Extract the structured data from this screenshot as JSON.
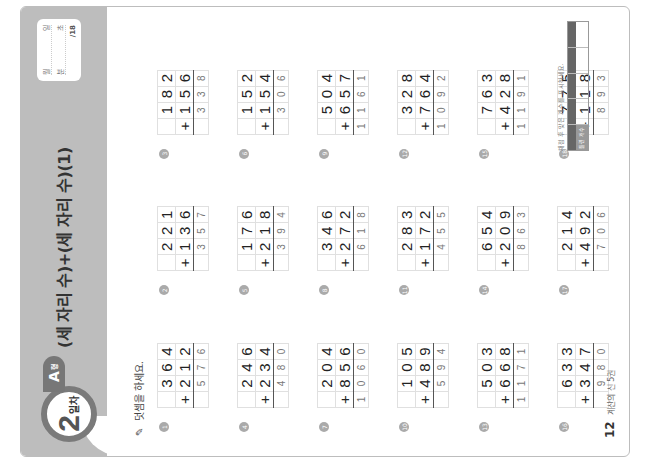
{
  "header": {
    "day_number": "2",
    "day_label": "일차",
    "type_letter": "A",
    "type_suffix": "형",
    "title": "(세 자리 수)+(세 자리 수)(1)",
    "score_box": {
      "date_labels": [
        "월",
        "일"
      ],
      "time_labels": [
        "분",
        "초"
      ],
      "score_total": "/18"
    }
  },
  "instruction": "덧셈을 하세요.",
  "problems": [
    {
      "num": "1",
      "top": [
        "",
        "3",
        "6",
        "4"
      ],
      "bottom": [
        "+",
        "2",
        "1",
        "2"
      ],
      "answer": [
        "",
        "5",
        "7",
        "6"
      ]
    },
    {
      "num": "2",
      "top": [
        "",
        "2",
        "2",
        "1"
      ],
      "bottom": [
        "+",
        "1",
        "3",
        "6"
      ],
      "answer": [
        "",
        "3",
        "5",
        "7"
      ]
    },
    {
      "num": "3",
      "top": [
        "",
        "1",
        "8",
        "2"
      ],
      "bottom": [
        "+",
        "1",
        "5",
        "6"
      ],
      "answer": [
        "",
        "3",
        "3",
        "8"
      ]
    },
    {
      "num": "4",
      "top": [
        "",
        "2",
        "4",
        "6"
      ],
      "bottom": [
        "+",
        "2",
        "3",
        "4"
      ],
      "answer": [
        "",
        "4",
        "8",
        "0"
      ]
    },
    {
      "num": "5",
      "top": [
        "",
        "1",
        "7",
        "6"
      ],
      "bottom": [
        "+",
        "2",
        "1",
        "8"
      ],
      "answer": [
        "",
        "3",
        "9",
        "4"
      ]
    },
    {
      "num": "6",
      "top": [
        "",
        "1",
        "5",
        "2"
      ],
      "bottom": [
        "+",
        "1",
        "5",
        "4"
      ],
      "answer": [
        "",
        "3",
        "0",
        "6"
      ]
    },
    {
      "num": "7",
      "top": [
        "",
        "2",
        "0",
        "4"
      ],
      "bottom": [
        "+",
        "8",
        "5",
        "6"
      ],
      "answer": [
        "1",
        "0",
        "6",
        "0"
      ]
    },
    {
      "num": "8",
      "top": [
        "",
        "3",
        "4",
        "6"
      ],
      "bottom": [
        "+",
        "2",
        "7",
        "2"
      ],
      "answer": [
        "",
        "6",
        "1",
        "8"
      ]
    },
    {
      "num": "9",
      "top": [
        "",
        "5",
        "0",
        "4"
      ],
      "bottom": [
        "+",
        "6",
        "5",
        "7"
      ],
      "answer": [
        "1",
        "1",
        "6",
        "1"
      ]
    },
    {
      "num": "10",
      "top": [
        "",
        "1",
        "0",
        "5"
      ],
      "bottom": [
        "+",
        "4",
        "8",
        "9"
      ],
      "answer": [
        "",
        "5",
        "9",
        "4"
      ]
    },
    {
      "num": "11",
      "top": [
        "",
        "2",
        "8",
        "3"
      ],
      "bottom": [
        "+",
        "1",
        "7",
        "2"
      ],
      "answer": [
        "",
        "4",
        "5",
        "5"
      ]
    },
    {
      "num": "12",
      "top": [
        "",
        "3",
        "2",
        "8"
      ],
      "bottom": [
        "+",
        "7",
        "6",
        "4"
      ],
      "answer": [
        "1",
        "0",
        "9",
        "2"
      ]
    },
    {
      "num": "13",
      "top": [
        "",
        "5",
        "0",
        "3"
      ],
      "bottom": [
        "+",
        "6",
        "6",
        "8"
      ],
      "answer": [
        "1",
        "1",
        "7",
        "1"
      ]
    },
    {
      "num": "14",
      "top": [
        "",
        "6",
        "5",
        "4"
      ],
      "bottom": [
        "+",
        "2",
        "0",
        "9"
      ],
      "answer": [
        "",
        "8",
        "6",
        "3"
      ]
    },
    {
      "num": "15",
      "top": [
        "",
        "7",
        "6",
        "3"
      ],
      "bottom": [
        "+",
        "4",
        "2",
        "8"
      ],
      "answer": [
        "1",
        "1",
        "9",
        "1"
      ]
    },
    {
      "num": "16",
      "top": [
        "",
        "6",
        "3",
        "3"
      ],
      "bottom": [
        "+",
        "3",
        "4",
        "7"
      ],
      "answer": [
        "",
        "9",
        "8",
        "0"
      ]
    },
    {
      "num": "17",
      "top": [
        "",
        "2",
        "1",
        "4"
      ],
      "bottom": [
        "+",
        "4",
        "9",
        "2"
      ],
      "answer": [
        "",
        "7",
        "0",
        "6"
      ]
    },
    {
      "num": "18",
      "top": [
        "",
        "7",
        "7",
        "5"
      ],
      "bottom": [
        "+",
        "1",
        "1",
        "8"
      ],
      "answer": [
        "",
        "8",
        "9",
        "3"
      ]
    }
  ],
  "footer": {
    "page_number": "12",
    "book_title": "계산의 신 5권",
    "check_caption": "채점 후 맞은 개수를 표시하세요.",
    "check_cells": [
      {
        "top": "",
        "bottom": "틀린 개수"
      },
      {
        "top": "",
        "bottom": ""
      },
      {
        "top": "",
        "bottom": ""
      },
      {
        "top": "",
        "bottom": ""
      },
      {
        "top": "",
        "bottom": ""
      }
    ]
  }
}
